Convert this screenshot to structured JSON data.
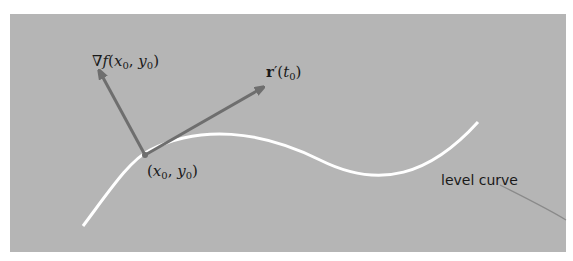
{
  "diagram": {
    "background_color": "#b5b5b5",
    "curve_color": "#ffffff",
    "arrow_color": "#6e6e6e",
    "labels": {
      "gradient": "∇f(x0, y0)",
      "tangent": "r′(t0)",
      "point": "(x0, y0)",
      "curve": "level curve"
    }
  }
}
